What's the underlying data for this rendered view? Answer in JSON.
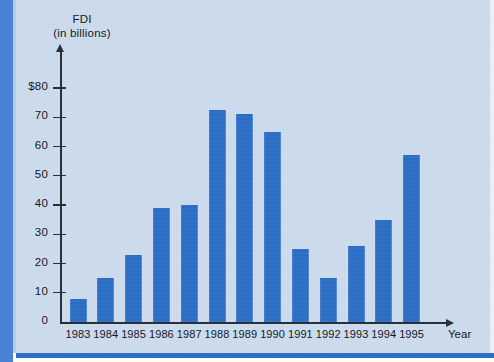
{
  "page": {
    "background_color": "#ccdcee",
    "accent_color": "#2c6fc6",
    "axis_color": "#2a2f38"
  },
  "chart_data": {
    "type": "bar",
    "title": "FDI",
    "subtitle": "(in billions)",
    "ylabel": "FDI (in billions)",
    "xlabel": "Year",
    "categories": [
      "1983",
      "1984",
      "1985",
      "1986",
      "1987",
      "1988",
      "1989",
      "1990",
      "1991",
      "1992",
      "1993",
      "1994",
      "1995"
    ],
    "values": [
      8,
      15,
      23,
      39,
      40,
      72.5,
      71,
      65,
      25,
      15,
      26,
      35,
      57
    ],
    "ylim": [
      0,
      80
    ],
    "ytick_labels": [
      "$80",
      "70",
      "60",
      "50",
      "40",
      "30",
      "20",
      "10",
      "0"
    ],
    "ytick_values": [
      80,
      70,
      60,
      50,
      40,
      30,
      20,
      10,
      0
    ],
    "grid": false,
    "legend": null,
    "bar_color": "#2c6fc6"
  }
}
